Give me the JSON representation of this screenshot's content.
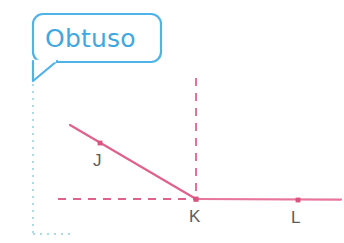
{
  "canvas": {
    "width": 344,
    "height": 243,
    "background": "#ffffff"
  },
  "callout": {
    "label": "Obtuso",
    "text_color": "#3FA8E0",
    "border_color": "#4FB3E8",
    "fill_color": "#ffffff",
    "box": {
      "x": 33,
      "y": 14,
      "width": 128,
      "height": 48,
      "corner_radius": 10
    },
    "tail_tip": {
      "x": 33,
      "y": 81
    },
    "stroke_width": 2.2
  },
  "guide": {
    "name": "pointer-dotted-guide",
    "color": "#A9DCE8",
    "dot_size": 2,
    "vertical": {
      "x": 33,
      "y_start": 84,
      "y_end": 234
    },
    "horizontal": {
      "y": 234,
      "x_start": 33,
      "x_end": 70
    }
  },
  "figure": {
    "type": "angle-diagram",
    "angle_name": "Obtuso",
    "stroke_color": "#E0628C",
    "dashed_color": "#E0628C",
    "solid_stroke_width": 2.2,
    "dashed_stroke_width": 1.8,
    "vertex": "K",
    "rays": [
      {
        "name": "ray-KJ",
        "from": "K",
        "to_point": {
          "x": 70,
          "y": 125
        },
        "style": "solid"
      },
      {
        "name": "ray-KL",
        "from": "K",
        "to_point": {
          "x": 341,
          "y": 199
        },
        "style": "solid"
      }
    ],
    "references": [
      {
        "name": "vertical-dashed-reference",
        "x1": 196,
        "y1": 78,
        "x2": 196,
        "y2": 199,
        "style": "dashed"
      },
      {
        "name": "horizontal-dashed-reference",
        "x1": 58,
        "y1": 199,
        "x2": 196,
        "y2": 199,
        "style": "dashed"
      }
    ],
    "points": [
      {
        "id": "J",
        "label": "J",
        "x": 100,
        "y": 143,
        "label_x": 93,
        "label_y": 152,
        "dot_color": "#D9547F",
        "label_color": "#5B5B5B"
      },
      {
        "id": "K",
        "label": "K",
        "x": 196,
        "y": 199,
        "label_x": 189,
        "label_y": 208,
        "dot_color": "#D9547F",
        "label_color": "#5B5B5B"
      },
      {
        "id": "L",
        "label": "L",
        "x": 298,
        "y": 200,
        "label_x": 291,
        "label_y": 209,
        "dot_color": "#D9547F",
        "label_color": "#5B5B5B"
      }
    ],
    "dot_radius": 2.6
  }
}
